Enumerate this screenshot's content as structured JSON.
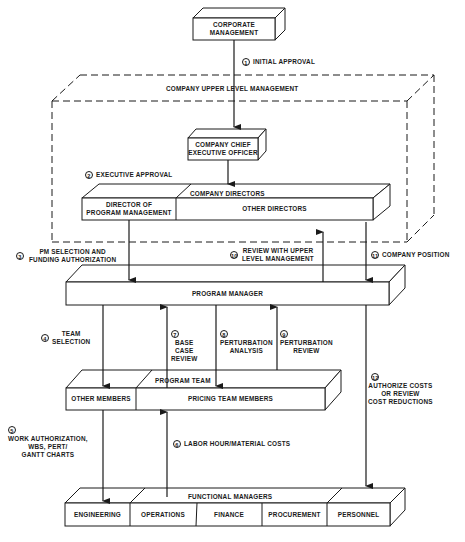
{
  "nodes": {
    "corporate_management": [
      "CORPORATE",
      "MANAGEMENT"
    ],
    "upper_level_group": "COMPANY UPPER LEVEL MANAGEMENT",
    "ceo": [
      "COMPANY CHIEF",
      "EXECUTIVE OFFICER"
    ],
    "company_directors": "COMPANY DIRECTORS",
    "director_pm": [
      "DIRECTOR OF",
      "PROGRAM MANAGEMENT"
    ],
    "other_directors": "OTHER DIRECTORS",
    "program_manager": "PROGRAM MANAGER",
    "program_team": "PROGRAM TEAM",
    "other_members": "OTHER MEMBERS",
    "pricing_team": "PRICING TEAM MEMBERS",
    "functional_managers": "FUNCTIONAL MANAGERS",
    "functions": [
      "ENGINEERING",
      "OPERATIONS",
      "FINANCE",
      "PROCUREMENT",
      "PERSONNEL"
    ]
  },
  "steps": [
    {
      "num": "1",
      "lines": [
        "INITIAL APPROVAL"
      ]
    },
    {
      "num": "2",
      "lines": [
        "EXECUTIVE APPROVAL"
      ]
    },
    {
      "num": "3",
      "lines": [
        "PM SELECTION AND",
        "FUNDING AUTHORIZATION"
      ]
    },
    {
      "num": "4",
      "lines": [
        "TEAM",
        "SELECTION"
      ]
    },
    {
      "num": "5",
      "lines": [
        "WORK AUTHORIZATION,",
        "WBS, PERT/",
        "GANTT CHARTS"
      ]
    },
    {
      "num": "6",
      "lines": [
        "LABOR HOUR/MATERIAL COSTS"
      ]
    },
    {
      "num": "7",
      "lines": [
        "BASE",
        "CASE",
        "REVIEW"
      ]
    },
    {
      "num": "8",
      "lines": [
        "PERTURBATION",
        "ANALYSIS"
      ]
    },
    {
      "num": "9",
      "lines": [
        "PERTURBATION",
        "REVIEW"
      ]
    },
    {
      "num": "10",
      "lines": [
        "REVIEW WITH UPPER",
        "LEVEL MANAGEMENT"
      ]
    },
    {
      "num": "11",
      "lines": [
        "COMPANY POSITION"
      ]
    },
    {
      "num": "12",
      "lines": [
        "AUTHORIZE COSTS",
        "OR REVIEW",
        "COST REDUCTIONS"
      ]
    }
  ]
}
